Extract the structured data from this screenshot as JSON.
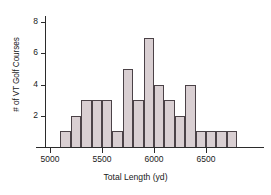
{
  "chart_data": {
    "type": "bar",
    "title": "",
    "xlabel": "Total Length (yd)",
    "ylabel": "# of VT Golf Courses",
    "xlim": [
      4950,
      6800
    ],
    "ylim": [
      0,
      8
    ],
    "bin_width": 100,
    "grid": false,
    "legend": null,
    "x_ticks": [
      5000,
      5500,
      6000,
      6500
    ],
    "x_tick_labels": [
      "5000",
      "5500",
      "6000",
      "6500"
    ],
    "y_ticks": [
      2,
      4,
      6,
      8
    ],
    "y_tick_labels": [
      "2",
      "4",
      "6",
      "8"
    ],
    "bin_edges": [
      5100,
      5200,
      5300,
      5400,
      5500,
      5600,
      5700,
      5800,
      5900,
      6000,
      6100,
      6200,
      6300,
      6400,
      6500,
      6600,
      6700,
      6800
    ],
    "categories": [
      "5100-5200",
      "5200-5300",
      "5300-5400",
      "5400-5500",
      "5500-5600",
      "5600-5700",
      "5700-5800",
      "5800-5900",
      "5900-6000",
      "6000-6100",
      "6100-6200",
      "6200-6300",
      "6300-6400",
      "6400-6500",
      "6500-6600",
      "6600-6700",
      "6700-6800"
    ],
    "values": [
      1,
      2,
      3,
      3,
      3,
      1,
      5,
      3,
      7,
      4,
      3,
      2,
      4,
      1,
      1,
      1,
      1
    ],
    "colors": {
      "bar_fill": "#d9cfd2",
      "bar_edge": "#4b4247",
      "axis": "#2b2b2b",
      "text": "#1a1a1a",
      "background": "#ffffff"
    }
  }
}
